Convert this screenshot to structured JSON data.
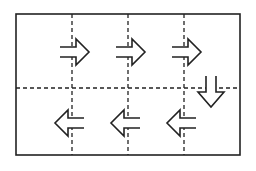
{
  "diagram": {
    "type": "snake-path-grid",
    "colors": {
      "stroke": "#222222",
      "background": "#ffffff"
    },
    "frame": {
      "x": 16,
      "y": 14,
      "width": 224,
      "height": 141
    },
    "grid": {
      "rows": 2,
      "dashed_vertical_x": [
        72,
        128,
        184
      ],
      "dashed_horizontal_y": 88
    },
    "arrows": [
      {
        "id": "arrow-right-1",
        "direction": "right",
        "cx": 76,
        "cy": 52
      },
      {
        "id": "arrow-right-2",
        "direction": "right",
        "cx": 132,
        "cy": 52
      },
      {
        "id": "arrow-right-3",
        "direction": "right",
        "cx": 188,
        "cy": 52
      },
      {
        "id": "arrow-down",
        "direction": "down",
        "cx": 211,
        "cy": 92
      },
      {
        "id": "arrow-left-1",
        "direction": "left",
        "cx": 180,
        "cy": 123
      },
      {
        "id": "arrow-left-2",
        "direction": "left",
        "cx": 124,
        "cy": 123
      },
      {
        "id": "arrow-left-3",
        "direction": "left",
        "cx": 68,
        "cy": 123
      }
    ]
  }
}
